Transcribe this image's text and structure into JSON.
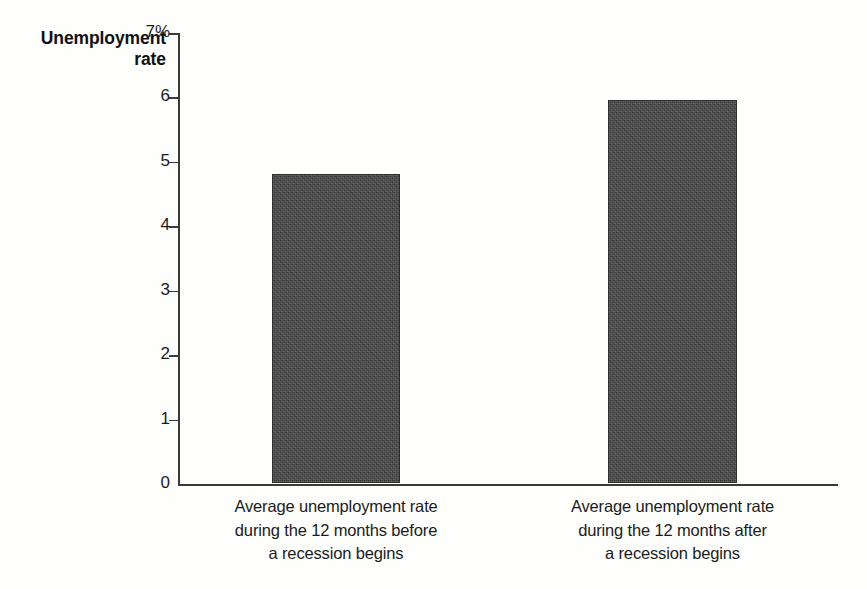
{
  "figure": {
    "background_color": "#fefefd",
    "bar_color": "#454545",
    "axis_color": "#3a3a3a",
    "text_color": "#1b1b1b"
  },
  "axis_title": {
    "line1": "Unemployment",
    "line2": "rate"
  },
  "chart_data": {
    "type": "bar",
    "title": "Unemployment rate",
    "xlabel": "",
    "ylabel": "Unemployment rate",
    "ylim": [
      0,
      7
    ],
    "ytick_labels": [
      "0",
      "1",
      "2",
      "3",
      "4",
      "5",
      "6",
      "7%"
    ],
    "ytick_values": [
      0,
      1,
      2,
      3,
      4,
      5,
      6,
      7
    ],
    "grid": false,
    "legend": false,
    "units": "percent",
    "categories": [
      "Average unemployment rate during the 12 months before a recession begins",
      "Average unemployment rate during the 12 months after a recession begins"
    ],
    "category_lines": [
      [
        "Average unemployment rate",
        "during the 12 months before",
        "a recession begins"
      ],
      [
        "Average unemployment rate",
        "during the 12 months after",
        "a recession begins"
      ]
    ],
    "values": [
      4.8,
      5.95
    ],
    "bar_color": "#454545"
  }
}
